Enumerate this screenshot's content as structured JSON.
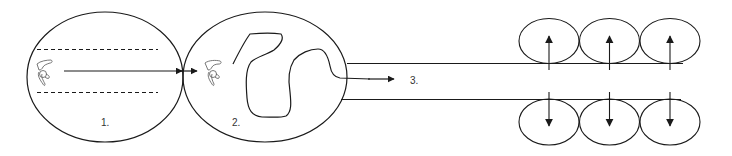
{
  "diagram": {
    "type": "process-flow",
    "stroke_color": "#1a1a1a",
    "figure_color": "#555555",
    "background": "#ffffff",
    "stages": [
      {
        "id": "stage-1",
        "label": "1.",
        "shape": "ellipse",
        "center": [
          105,
          77
        ],
        "rx": 78,
        "ry": 65,
        "content": "swimmer moving straight between dashed lane lines"
      },
      {
        "id": "stage-2",
        "label": "2.",
        "shape": "ellipse",
        "center": [
          265,
          77
        ],
        "rx": 82,
        "ry": 65,
        "content": "swimmer with meandering winding path"
      },
      {
        "id": "stage-3",
        "label": "3.",
        "shape": "channel",
        "content": "path exits into channel bounded by two lines, flanked by rows of small circles with outward arrows"
      }
    ],
    "labels": {
      "stage1": "1.",
      "stage2": "2.",
      "stage3": "3."
    },
    "top_row_circles": [
      {
        "center": [
          549,
          41
        ],
        "arrow": "up"
      },
      {
        "center": [
          609,
          41
        ],
        "arrow": "up"
      },
      {
        "center": [
          670,
          41
        ],
        "arrow": "up"
      }
    ],
    "bottom_row_circles": [
      {
        "center": [
          549,
          122
        ],
        "arrow": "down"
      },
      {
        "center": [
          609,
          122
        ],
        "arrow": "down"
      },
      {
        "center": [
          670,
          122
        ],
        "arrow": "down"
      }
    ],
    "icons": [
      "swimmer-icon",
      "swimmer-icon"
    ]
  }
}
